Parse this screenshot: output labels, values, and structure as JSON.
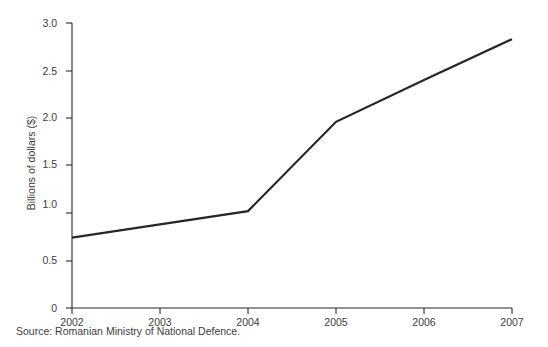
{
  "figure": {
    "source_note": "Source: Romanian Ministry of National Defence.",
    "background_color": "#ffffff",
    "line_color": "#262626",
    "axis_color": "#2b2b2b",
    "text_color": "#3c3c3c"
  },
  "chart_data": {
    "type": "line",
    "title": "",
    "subtitle": "",
    "xlabel": "",
    "ylabel": "Billions of dollars ($)",
    "x": [
      "2002",
      "2003",
      "2004",
      "2005",
      "2006",
      "2007"
    ],
    "categories": [
      "2002",
      "2003",
      "2004",
      "2005",
      "2006",
      "2007"
    ],
    "values": [
      0.74,
      0.88,
      1.02,
      1.96,
      2.4,
      2.83
    ],
    "series": [
      {
        "name": "Defence budget",
        "values": [
          0.74,
          0.88,
          1.02,
          1.96,
          2.4,
          2.83
        ]
      }
    ],
    "xtick_labels": [
      "2002",
      "2003",
      "2004",
      "2005",
      "2006",
      "2007"
    ],
    "ytick_labels": [
      "0",
      "0.5",
      "1.0",
      "1.5",
      "2.0",
      "2.5",
      "3.0"
    ],
    "ytick_values": [
      0,
      0.5,
      1.0,
      1.5,
      2.0,
      2.5,
      3.0
    ],
    "ylim": [
      0,
      3.0
    ],
    "xlim": [
      "2002",
      "2007"
    ],
    "grid": false,
    "legend": false,
    "legend_position": "none",
    "vertices": [
      "2002",
      "2004",
      "2005",
      "2007"
    ],
    "annotations": []
  }
}
